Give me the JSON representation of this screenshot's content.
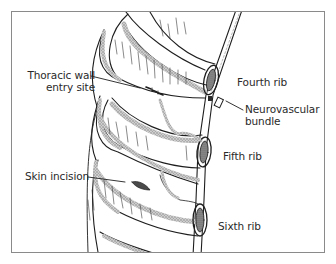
{
  "diagram": {
    "type": "anatomical-illustration",
    "labels": {
      "thoracic_wall_line1": "Thoracic wall",
      "thoracic_wall_line2": "entry site",
      "fourth_rib": "Fourth rib",
      "neurovascular_line1": "Neurovascular",
      "neurovascular_line2": "bundle",
      "fifth_rib": "Fifth rib",
      "skin_incision": "Skin incision",
      "sixth_rib": "Sixth rib"
    },
    "colors": {
      "line": "#1e1e1e",
      "stipple": "#9a9a9a",
      "frame": "#8a8a8a",
      "text": "#2a2a2a",
      "background": "#ffffff"
    }
  }
}
